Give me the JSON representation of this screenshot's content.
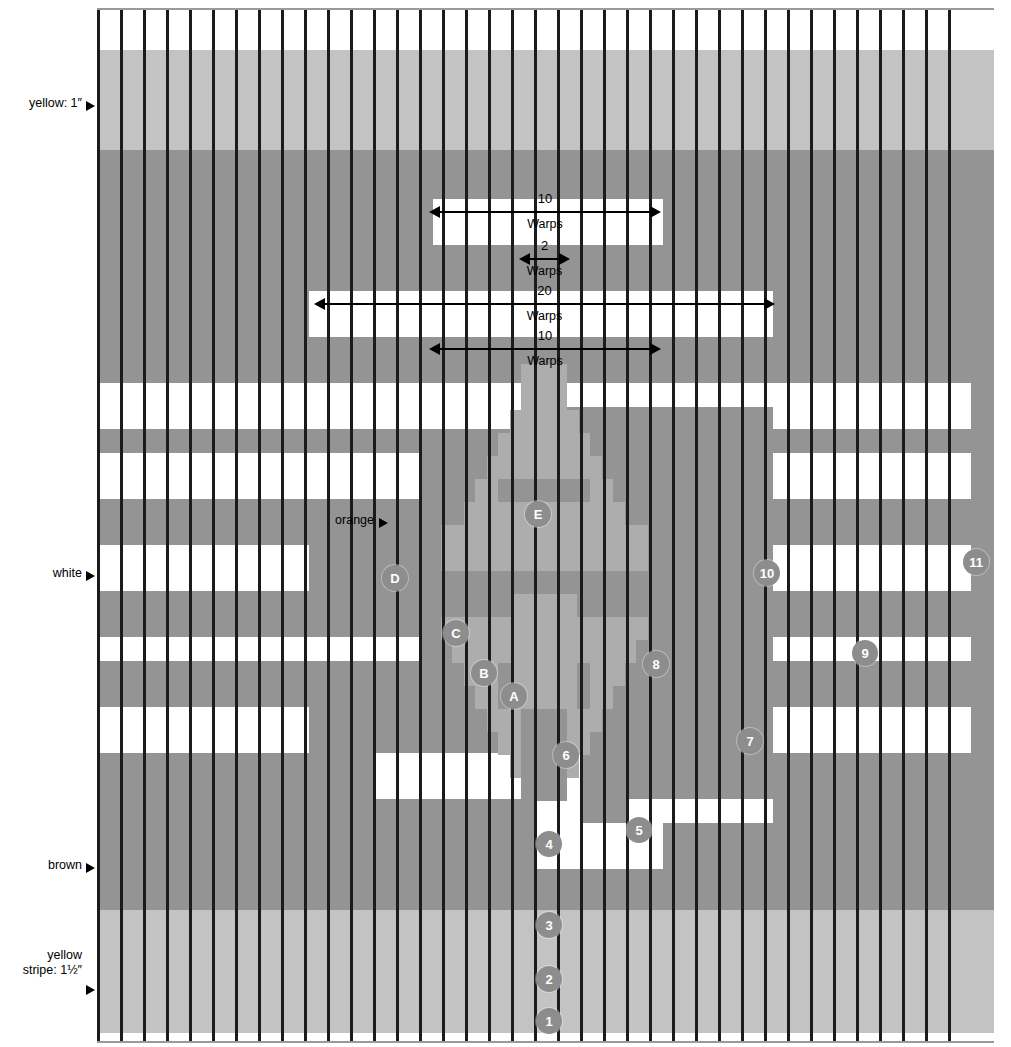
{
  "diagram": {
    "grid": {
      "warp_count": 38,
      "warp_spacing_px": 23,
      "left_px": 97,
      "top_px": 8,
      "width_px": 897,
      "height_px": 1031
    }
  },
  "colors": {
    "white": "#ffffff",
    "brown": "#949494",
    "yellow": "#c3c3c3",
    "orange": "#adadad",
    "warp_line": "#1b1b1b",
    "marker_fill": "#8d8d8d",
    "marker_text": "#ffffff"
  },
  "side_labels": [
    {
      "id": "yellow-top",
      "text": "yellow: 1″",
      "x": 8,
      "y": 96,
      "arrow_y": 101
    },
    {
      "id": "orange",
      "text": "orange",
      "x": 318,
      "y": 513,
      "arrow_y": 518
    },
    {
      "id": "white",
      "text": "white",
      "x": 38,
      "y": 566,
      "arrow_y": 571
    },
    {
      "id": "brown",
      "text": "brown",
      "x": 37,
      "y": 858,
      "arrow_y": 863
    },
    {
      "id": "yellow-stripe",
      "text": "yellow\nstripe: 1½″",
      "x": 8,
      "y": 948,
      "arrow_y": 985
    }
  ],
  "dimensions": [
    {
      "id": "dim-10-top",
      "number": "10",
      "unit": "Warps",
      "x": 431,
      "y": 211,
      "width": 228
    },
    {
      "id": "dim-2",
      "number": "2",
      "unit": "Warps",
      "x": 521,
      "y": 258,
      "width": 47
    },
    {
      "id": "dim-20",
      "number": "20",
      "unit": "Warps",
      "x": 316,
      "y": 303,
      "width": 457
    },
    {
      "id": "dim-10-bottom",
      "number": "10",
      "unit": "Warps",
      "x": 431,
      "y": 348,
      "width": 228
    }
  ],
  "markers": {
    "letters": [
      {
        "label": "E",
        "x": 538,
        "y": 514
      },
      {
        "label": "D",
        "x": 395,
        "y": 578
      },
      {
        "label": "C",
        "x": 456,
        "y": 633
      },
      {
        "label": "B",
        "x": 484,
        "y": 673
      },
      {
        "label": "A",
        "x": 514,
        "y": 696
      }
    ],
    "numbers": [
      {
        "label": "1",
        "x": 549,
        "y": 1021
      },
      {
        "label": "2",
        "x": 549,
        "y": 979
      },
      {
        "label": "3",
        "x": 549,
        "y": 925
      },
      {
        "label": "4",
        "x": 549,
        "y": 844
      },
      {
        "label": "5",
        "x": 639,
        "y": 830
      },
      {
        "label": "6",
        "x": 566,
        "y": 755
      },
      {
        "label": "7",
        "x": 750,
        "y": 741
      },
      {
        "label": "8",
        "x": 656,
        "y": 664
      },
      {
        "label": "9",
        "x": 865,
        "y": 653
      },
      {
        "label": "10",
        "x": 767,
        "y": 573
      },
      {
        "label": "11",
        "x": 976,
        "y": 562
      }
    ]
  },
  "bands": [
    {
      "id": "white-top",
      "color": "white",
      "y": 0,
      "h": 40
    },
    {
      "id": "yellow-top",
      "color": "yellow",
      "y": 40,
      "h": 100
    },
    {
      "id": "brown-main",
      "color": "brown",
      "y": 140,
      "h": 760
    },
    {
      "id": "yellow-bottom",
      "color": "yellow",
      "y": 900,
      "h": 123
    },
    {
      "id": "white-bottom",
      "color": "white",
      "y": 1023,
      "h": 8
    }
  ]
}
